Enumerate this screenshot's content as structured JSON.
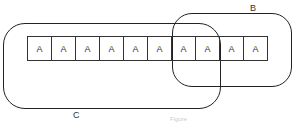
{
  "diagram": {
    "cells": [
      "A",
      "A",
      "A",
      "A",
      "A",
      "A",
      "A",
      "A",
      "A",
      "A"
    ],
    "sets": {
      "B": {
        "label": "B"
      },
      "C": {
        "label": "C"
      }
    },
    "caption": "Figure"
  }
}
